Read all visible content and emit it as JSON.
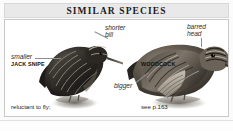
{
  "header": {
    "title": "SIMILAR SPECIES"
  },
  "panel": {
    "background_color": "#ffffff",
    "border_color": "#c9c9c9",
    "header_background_color": "#e9e9e9"
  },
  "species": [
    {
      "id": "jack-snipe",
      "name": "JACK SNIPE",
      "note_line_1": "reluctant to fly;",
      "note_line_2": "see p.165",
      "page_reference": "see p.165"
    },
    {
      "id": "woodcock",
      "name": "WOODCOCK",
      "note_line_1": "see p.163",
      "page_reference": "see p.163"
    }
  ],
  "annotations": [
    {
      "id": "smaller",
      "text": "smaller",
      "style": "italic",
      "target": "jack-snipe"
    },
    {
      "id": "shorter-bill",
      "text": "shorter\nbill",
      "style": "italic",
      "target": "jack-snipe"
    },
    {
      "id": "barred-head",
      "text": "barred\nhead",
      "style": "italic",
      "target": "woodcock"
    },
    {
      "id": "bigger",
      "text": "bigger",
      "style": "italic",
      "target": "woodcock"
    }
  ],
  "annotation_text": {
    "smaller": "smaller",
    "shorter_bill": "shorter\nbill",
    "barred_head": "barred\nhead",
    "bigger": "bigger"
  },
  "illustrations": [
    {
      "id": "jack-snipe-illustration",
      "alt": "jack-snipe-bird-photo"
    },
    {
      "id": "woodcock-illustration",
      "alt": "woodcock-bird-photo"
    }
  ]
}
